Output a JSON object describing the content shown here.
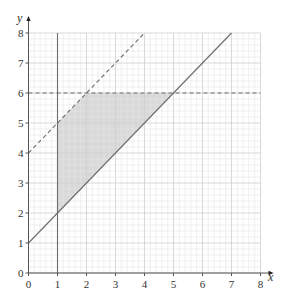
{
  "chart_data": {
    "type": "line",
    "title": "",
    "xlabel": "x",
    "ylabel": "y",
    "xlim": [
      0,
      8
    ],
    "ylim": [
      0,
      8
    ],
    "grid": true,
    "grid_minor_step": 0.2,
    "grid_major_step": 1,
    "x_ticks": [
      "0",
      "1",
      "2",
      "3",
      "4",
      "5",
      "6",
      "7",
      "8"
    ],
    "y_ticks": [
      "0",
      "1",
      "2",
      "3",
      "4",
      "5",
      "6",
      "7",
      "8"
    ],
    "series": [
      {
        "name": "y = x + 1",
        "style": "solid",
        "points": [
          [
            0,
            1
          ],
          [
            7,
            8
          ]
        ]
      },
      {
        "name": "y = x + 4",
        "style": "dashed",
        "points": [
          [
            0,
            4
          ],
          [
            4,
            8
          ]
        ]
      },
      {
        "name": "y = 6",
        "style": "dashed",
        "points": [
          [
            0,
            6
          ],
          [
            8,
            6
          ]
        ]
      },
      {
        "name": "x = 1",
        "style": "solid",
        "points": [
          [
            1,
            0
          ],
          [
            1,
            8
          ]
        ]
      }
    ],
    "shaded_region": {
      "vertices": [
        [
          1,
          2
        ],
        [
          1,
          5
        ],
        [
          2,
          6
        ],
        [
          5,
          6
        ]
      ],
      "color": "#d9d9d9"
    },
    "legend": null
  },
  "colors": {
    "grid_minor": "#e6e6e6",
    "grid_major": "#cfcfcf",
    "line": "#6b6b6b",
    "axis": "#555555",
    "shade": "#d9d9d9"
  }
}
